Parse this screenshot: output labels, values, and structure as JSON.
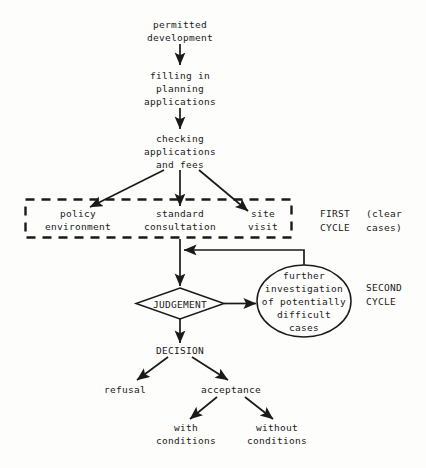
{
  "diagram": {
    "colors": {
      "background": "#fdfdfb",
      "ink": "#1a1a1a",
      "line": "#1a1a1a"
    },
    "nodes": {
      "permitted_development": "permitted\ndevelopment",
      "filling_in": "filling in\nplanning\napplications",
      "checking": "checking\napplications\nand fees",
      "policy": "policy\nenvironment",
      "standard": "standard\nconsultation",
      "site_visit": "site\nvisit",
      "judgement": "JUDGEMENT",
      "further_investigation": "further\ninvestigation\nof potentially\ndifficult\ncases",
      "decision": "DECISION",
      "refusal": "refusal",
      "acceptance": "acceptance",
      "with_conditions": "with\nconditions",
      "without_conditions": "without\nconditions"
    },
    "annotations": {
      "first_cycle": "FIRST\nCYCLE",
      "clear_cases": "(clear\ncases)",
      "second_cycle": "SECOND\nCYCLE"
    }
  }
}
